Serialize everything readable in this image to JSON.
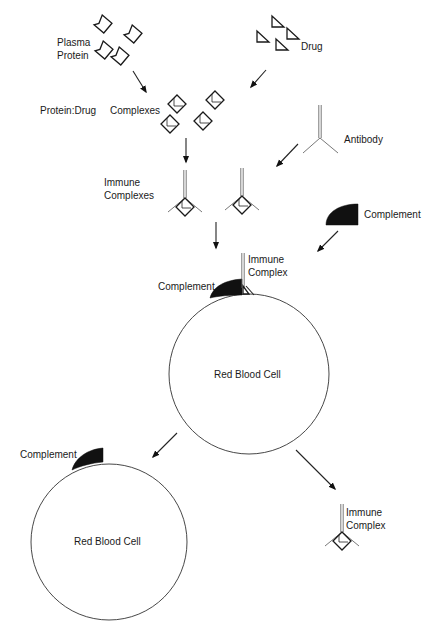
{
  "diagram": {
    "colors": {
      "ink": "#1a1a1a",
      "complement_fill": "#111111",
      "background": "#ffffff"
    },
    "labels": {
      "plasma_protein_line1": "Plasma",
      "plasma_protein_line2": "Protein",
      "drug": "Drug",
      "protein_drug": "Protein:Drug",
      "complexes": "Complexes",
      "antibody": "Antibody",
      "immune_complexes_line1": "Immune",
      "immune_complexes_line2": "Complexes",
      "complement_free": "Complement",
      "immune_complex_bound_line1": "Immune",
      "immune_complex_bound_line2": "Complex",
      "complement_bound": "Complement",
      "red_blood_cell_1": "Red Blood Cell",
      "complement_bottom": "Complement",
      "red_blood_cell_2": "Red Blood Cell",
      "immune_complex_released_line1": "Immune",
      "immune_complex_released_line2": "Complex"
    },
    "nodes": [
      {
        "id": "plasma-protein",
        "count": 4,
        "shape": "notched-diamond"
      },
      {
        "id": "drug",
        "count": 4,
        "shape": "right-triangle"
      },
      {
        "id": "protein-drug-complexes",
        "count": 4,
        "shape": "diamond-with-triangle"
      },
      {
        "id": "antibody",
        "count": 1,
        "shape": "Y"
      },
      {
        "id": "immune-complexes",
        "count": 2,
        "shape": "Y-with-diamond"
      },
      {
        "id": "complement",
        "count": 1,
        "shape": "quarter-disc"
      },
      {
        "id": "red-blood-cell-with-complex",
        "count": 1,
        "shape": "circle"
      },
      {
        "id": "red-blood-cell-with-complement",
        "count": 1,
        "shape": "circle"
      },
      {
        "id": "released-immune-complex",
        "count": 1,
        "shape": "Y-with-diamond"
      }
    ],
    "edges": [
      {
        "from": "plasma-protein",
        "to": "protein-drug-complexes"
      },
      {
        "from": "drug",
        "to": "protein-drug-complexes"
      },
      {
        "from": "protein-drug-complexes",
        "to": "immune-complexes"
      },
      {
        "from": "antibody",
        "to": "immune-complexes"
      },
      {
        "from": "immune-complexes",
        "to": "red-blood-cell-with-complex"
      },
      {
        "from": "complement",
        "to": "red-blood-cell-with-complex"
      },
      {
        "from": "red-blood-cell-with-complex",
        "to": "red-blood-cell-with-complement"
      },
      {
        "from": "red-blood-cell-with-complex",
        "to": "released-immune-complex"
      }
    ]
  }
}
